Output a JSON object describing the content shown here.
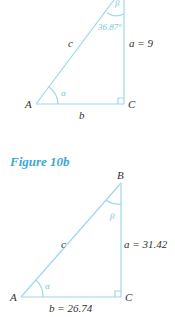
{
  "colors": {
    "line": "#9ed8ea",
    "angle_text": "#7cc4dc",
    "label": "#333333",
    "caption": "#3aa8d8"
  },
  "figure_a": {
    "vertices": {
      "A": "A",
      "B": "β",
      "C": "C"
    },
    "sides": {
      "c": "c",
      "a": "a = 9",
      "b": "b"
    },
    "angles": {
      "alpha": "α",
      "beta": "β",
      "beta_value": "36.87°"
    }
  },
  "figure_b": {
    "caption": "Figure 10b",
    "vertices": {
      "A": "A",
      "B": "B",
      "C": "C"
    },
    "sides": {
      "c": "c",
      "a": "a = 31.42",
      "b": "b = 26.74"
    },
    "angles": {
      "alpha": "α",
      "beta": "β"
    }
  }
}
